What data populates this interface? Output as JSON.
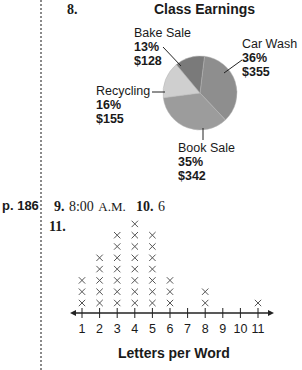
{
  "page_ref": "p. 186",
  "problem8": {
    "number": "8.",
    "chart_title": "Class Earnings",
    "slices": [
      {
        "name": "Car Wash",
        "percent": "36%",
        "amount": "$355",
        "color": "#8e8e8e"
      },
      {
        "name": "Book Sale",
        "percent": "35%",
        "amount": "$342",
        "color": "#9c9c9c"
      },
      {
        "name": "Recycling",
        "percent": "16%",
        "amount": "$155",
        "color": "#cfcfcf"
      },
      {
        "name": "Bake Sale",
        "percent": "13%",
        "amount": "$128",
        "color": "#7a7a7a"
      }
    ]
  },
  "problem9": {
    "number": "9.",
    "answer": "8:00",
    "suffix": "A.M."
  },
  "problem10": {
    "number": "10.",
    "answer": "6"
  },
  "problem11": {
    "number": "11.",
    "axis_title": "Letters per Word",
    "tick_labels": [
      "1",
      "2",
      "3",
      "4",
      "5",
      "6",
      "7",
      "8",
      "9",
      "10",
      "11"
    ]
  },
  "chart_data": [
    {
      "type": "pie",
      "title": "Class Earnings",
      "categories": [
        "Car Wash",
        "Book Sale",
        "Recycling",
        "Bake Sale"
      ],
      "values": [
        36,
        35,
        16,
        13
      ],
      "amounts": [
        355,
        342,
        155,
        128
      ],
      "unit": "%"
    },
    {
      "type": "line_plot",
      "title": "",
      "xlabel": "Letters per Word",
      "ylabel": "",
      "categories": [
        1,
        2,
        3,
        4,
        5,
        6,
        7,
        8,
        9,
        10,
        11
      ],
      "values": [
        3,
        5,
        7,
        8,
        7,
        3,
        0,
        2,
        0,
        0,
        1
      ],
      "marker": "x",
      "grid": false
    }
  ]
}
